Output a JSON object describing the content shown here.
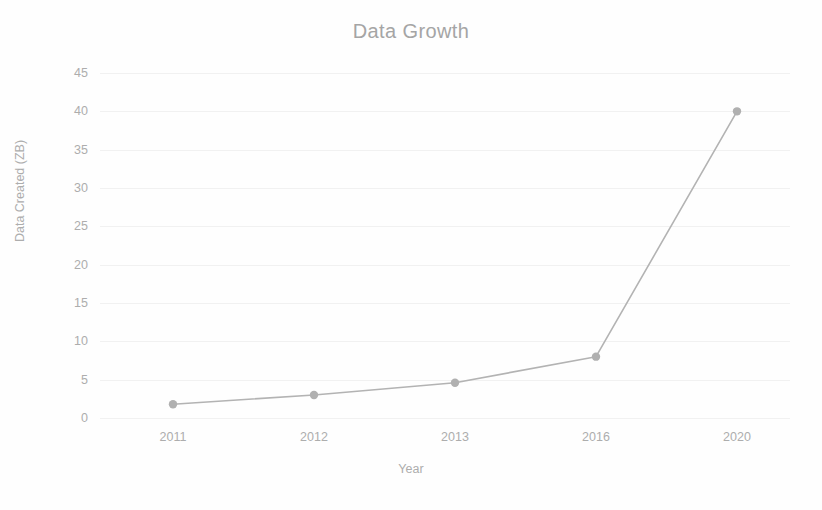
{
  "chart_data": {
    "type": "line",
    "title": "Data Growth",
    "subtitle": "",
    "xlabel": "Year",
    "ylabel": "Data Created (ZB)",
    "categories": [
      "2011",
      "2012",
      "2013",
      "2016",
      "2020"
    ],
    "values": [
      1.8,
      3,
      4.6,
      8,
      40
    ],
    "series": [
      {
        "name": "Data Created (ZB)",
        "values": [
          1.8,
          3,
          4.6,
          8,
          40
        ]
      }
    ],
    "ylim": [
      0,
      45
    ],
    "yticks": [
      0,
      5,
      10,
      15,
      20,
      25,
      30,
      35,
      40,
      45
    ],
    "ytick_labels": [
      "0",
      "5",
      "10",
      "15",
      "20",
      "25",
      "30",
      "35",
      "40",
      "45"
    ],
    "grid": true,
    "grid_axis": "y",
    "legend": false,
    "legend_position": "none",
    "marker": "circle",
    "line_color": "#b3b3b3",
    "marker_color": "#b0b0b0",
    "grid_color": "#f1f1f1",
    "text_color": "#adadad",
    "title_color": "#a5a5a5",
    "background_color": "#fefefe"
  }
}
